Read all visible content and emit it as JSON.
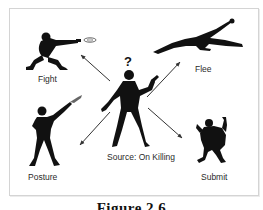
{
  "diagram": {
    "center": {
      "label": "Source: On Killing",
      "symbol": "?"
    },
    "responses": [
      {
        "id": "fight",
        "label": "Fight",
        "direction": "up-left"
      },
      {
        "id": "flee",
        "label": "Flee",
        "direction": "up-right"
      },
      {
        "id": "posture",
        "label": "Posture",
        "direction": "down-left"
      },
      {
        "id": "submit",
        "label": "Submit",
        "direction": "down-right"
      }
    ],
    "caption": "Figure 2.6"
  },
  "colors": {
    "silhouette": "#111111",
    "arrow": "#333333",
    "frame": "#d4d4d4",
    "text": "#2a2a2a"
  }
}
